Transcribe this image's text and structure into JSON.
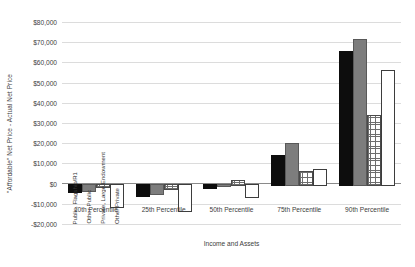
{
  "chart_data": {
    "type": "bar",
    "title": "",
    "xlabel": "Income and Assets",
    "ylabel": "\"Affordable\" Net Price - Actual Net Price",
    "categories": [
      "10th Percentile",
      "25th Percentile",
      "50th Percentile",
      "75th Percentile",
      "90th Percentile"
    ],
    "series": [
      {
        "name": "Public, Flagship/R1",
        "color": "#0d0d0d",
        "fill": "solid-black",
        "values": [
          -3500,
          -5500,
          -1500,
          14000,
          65500
        ]
      },
      {
        "name": "Other Public",
        "color": "#7d7d7d",
        "fill": "solid-gray",
        "values": [
          -3000,
          -4500,
          -500,
          20000,
          71500
        ]
      },
      {
        "name": "Private, Large Endowment",
        "color": "#6e6e6e",
        "fill": "crosshatch",
        "values": [
          -1000,
          -2000,
          2000,
          6000,
          34000
        ]
      },
      {
        "name": "Other Private",
        "color": "#ffffff",
        "fill": "white-outline",
        "values": [
          -11000,
          -13000,
          -6000,
          7000,
          56000
        ]
      }
    ],
    "ylim": [
      -20000,
      80000
    ],
    "ytick_step": 10000,
    "ytick_labels": [
      "$80,000",
      "$70,000",
      "$60,000",
      "$50,000",
      "$40,000",
      "$30,000",
      "$20,000",
      "$10,000",
      "$0",
      "-$10,000",
      "-$20,000"
    ],
    "ytick_values": [
      80000,
      70000,
      60000,
      50000,
      40000,
      30000,
      20000,
      10000,
      0,
      -10000,
      -20000
    ],
    "grid": true,
    "legend_position": "inside-plot-rotated"
  }
}
